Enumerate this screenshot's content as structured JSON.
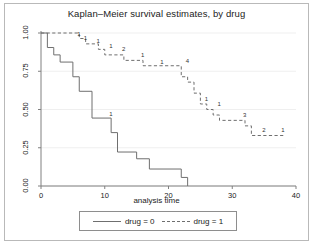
{
  "chart_data": {
    "type": "line",
    "title": "Kaplan–Meier survival estimates, by drug",
    "xlabel": "analysis time",
    "ylabel": "",
    "xlim": [
      0,
      40
    ],
    "ylim": [
      0,
      1
    ],
    "xticks": [
      "0",
      "10",
      "20",
      "30",
      "40"
    ],
    "xtick_values": [
      0,
      10,
      20,
      30,
      40
    ],
    "yticks": [
      "0.00",
      "0.25",
      "0.50",
      "0.75",
      "1.00"
    ],
    "ytick_values": [
      0,
      0.25,
      0.5,
      0.75,
      1
    ],
    "grid": "horizontal",
    "legend_position": "bottom-center",
    "series": [
      {
        "name": "drug = 0",
        "style": "solid",
        "color": "#6f6f6f",
        "points": [
          [
            0,
            1.0
          ],
          [
            1,
            1.0
          ],
          [
            1,
            0.905
          ],
          [
            2,
            0.905
          ],
          [
            2,
            0.857
          ],
          [
            3,
            0.857
          ],
          [
            3,
            0.81
          ],
          [
            5,
            0.81
          ],
          [
            5,
            0.714
          ],
          [
            6,
            0.714
          ],
          [
            6,
            0.619
          ],
          [
            8,
            0.619
          ],
          [
            8,
            0.444
          ],
          [
            11,
            0.444
          ],
          [
            11,
            0.349
          ],
          [
            12,
            0.349
          ],
          [
            12,
            0.222
          ],
          [
            15,
            0.222
          ],
          [
            15,
            0.178
          ],
          [
            17,
            0.178
          ],
          [
            17,
            0.111
          ],
          [
            22,
            0.111
          ],
          [
            22,
            0.056
          ],
          [
            23,
            0.056
          ],
          [
            23,
            0.0
          ]
        ],
        "censor_marks": [
          {
            "time": 11,
            "count": "1",
            "survival": 0.46
          }
        ]
      },
      {
        "name": "drug = 1",
        "style": "dashed",
        "color": "#6f6f6f",
        "points": [
          [
            0,
            1.0
          ],
          [
            6,
            1.0
          ],
          [
            6,
            0.964
          ],
          [
            7,
            0.964
          ],
          [
            7,
            0.929
          ],
          [
            9,
            0.929
          ],
          [
            9,
            0.893
          ],
          [
            10,
            0.893
          ],
          [
            10,
            0.857
          ],
          [
            13,
            0.857
          ],
          [
            13,
            0.821
          ],
          [
            16,
            0.821
          ],
          [
            16,
            0.786
          ],
          [
            22,
            0.786
          ],
          [
            22,
            0.714
          ],
          [
            23,
            0.714
          ],
          [
            23,
            0.679
          ],
          [
            24,
            0.679
          ],
          [
            24,
            0.607
          ],
          [
            25,
            0.607
          ],
          [
            25,
            0.536
          ],
          [
            26,
            0.536
          ],
          [
            26,
            0.5
          ],
          [
            27,
            0.5
          ],
          [
            27,
            0.464
          ],
          [
            28,
            0.464
          ],
          [
            28,
            0.429
          ],
          [
            32,
            0.429
          ],
          [
            32,
            0.393
          ],
          [
            33,
            0.393
          ],
          [
            33,
            0.33
          ],
          [
            38,
            0.33
          ]
        ],
        "censor_marks": [
          {
            "time": 6,
            "count": "1",
            "survival": 0.98
          },
          {
            "time": 7,
            "count": "1",
            "survival": 0.955
          },
          {
            "time": 9,
            "count": "1",
            "survival": 0.935
          },
          {
            "time": 11,
            "count": "1",
            "survival": 0.9
          },
          {
            "time": 13,
            "count": "2",
            "survival": 0.885
          },
          {
            "time": 16,
            "count": "1",
            "survival": 0.845
          },
          {
            "time": 19,
            "count": "1",
            "survival": 0.8
          },
          {
            "time": 23,
            "count": "4",
            "survival": 0.805
          },
          {
            "time": 26,
            "count": "1",
            "survival": 0.555
          },
          {
            "time": 28,
            "count": "1",
            "survival": 0.525
          },
          {
            "time": 32,
            "count": "3",
            "survival": 0.45
          },
          {
            "time": 35,
            "count": "2",
            "survival": 0.35
          },
          {
            "time": 38,
            "count": "1",
            "survival": 0.355
          }
        ]
      }
    ]
  },
  "legend": {
    "entries": [
      {
        "label": "drug = 0",
        "style": "solid"
      },
      {
        "label": "drug = 1",
        "style": "dashed"
      }
    ]
  },
  "colors": {
    "line": "#6f6f6f",
    "axis": "#808080",
    "grid": "#efefef",
    "frame": "#b9b9b9",
    "text": "#222222"
  }
}
